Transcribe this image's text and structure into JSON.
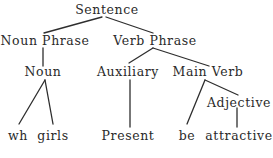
{
  "diagram": {
    "type": "syntax-tree",
    "nodes": {
      "sentence": "Sentence",
      "noun_phrase": "Noun Phrase",
      "verb_phrase": "Verb Phrase",
      "noun": "Noun",
      "auxiliary": "Auxiliary",
      "main_verb": "Main Verb",
      "adjective": "Adjective",
      "wh": "wh",
      "girls": "girls",
      "present": "Present",
      "be": "be",
      "attractive": "attractive"
    },
    "edges": [
      [
        "Sentence",
        "Noun Phrase"
      ],
      [
        "Sentence",
        "Verb Phrase"
      ],
      [
        "Noun Phrase",
        "Noun"
      ],
      [
        "Verb Phrase",
        "Auxiliary"
      ],
      [
        "Verb Phrase",
        "Main Verb"
      ],
      [
        "Noun",
        "wh"
      ],
      [
        "Noun",
        "girls"
      ],
      [
        "Auxiliary",
        "Present"
      ],
      [
        "Main Verb",
        "be"
      ],
      [
        "Main Verb",
        "Adjective"
      ],
      [
        "Adjective",
        "attractive"
      ]
    ],
    "colors": {
      "text": "#2a2a2a",
      "lines": "#2e2e2e",
      "background": "#ffffff"
    }
  }
}
